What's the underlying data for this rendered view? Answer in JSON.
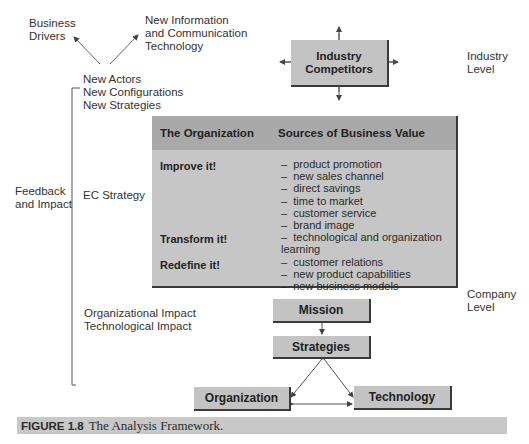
{
  "top": {
    "business_drivers": [
      "Business",
      "Drivers"
    ],
    "new_ict": [
      "New Information",
      "and Communication",
      "Technology"
    ],
    "new_items": [
      "New Actors",
      "New Configurations",
      "New Strategies"
    ]
  },
  "industry": {
    "box_label": [
      "Industry",
      "Competitors"
    ],
    "level_label": [
      "Industry",
      "Level"
    ]
  },
  "left": {
    "feedback": [
      "Feedback",
      "and Impact"
    ],
    "ec_strategy": "EC Strategy",
    "impacts": [
      "Organizational Impact",
      "Technological Impact"
    ]
  },
  "org_table": {
    "header": {
      "col1": "The Organization",
      "col2": "Sources of Business Value"
    },
    "rows": [
      {
        "label": "Improve it!",
        "values": [
          "product promotion",
          "new sales channel",
          "direct savings",
          "time to market",
          "customer service",
          "brand image"
        ]
      },
      {
        "label": "Transform it!",
        "values": [
          "technological and organization learning",
          "customer relations"
        ]
      },
      {
        "label": "Redefine it!",
        "values": [
          "new product capabilities",
          "new business models"
        ]
      }
    ]
  },
  "company": {
    "level_label": [
      "Company",
      "Level"
    ],
    "mission": "Mission",
    "strategies": "Strategies",
    "organization": "Organization",
    "technology": "Technology"
  },
  "caption": {
    "figure": "FIGURE 1.8",
    "title": "The Analysis Framework."
  },
  "colors": {
    "box_fill": "#c3c3c3",
    "table_header": "#a9a9a9",
    "table_body": "#c6c6c6",
    "caption_bar": "#c8c8c8"
  }
}
